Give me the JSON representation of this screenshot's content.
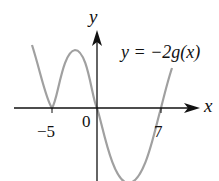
{
  "diagram": {
    "type": "function-graph",
    "curve_label": "y = −2g(x)",
    "axis_labels": {
      "x": "x",
      "y": "y"
    },
    "origin_label": "0",
    "tick_labels": [
      "−5",
      "7"
    ],
    "roots": [
      -5,
      0,
      7
    ],
    "colors": {
      "curve": "#a0a0a0",
      "axes": "#111111",
      "background": "#ffffff"
    }
  }
}
